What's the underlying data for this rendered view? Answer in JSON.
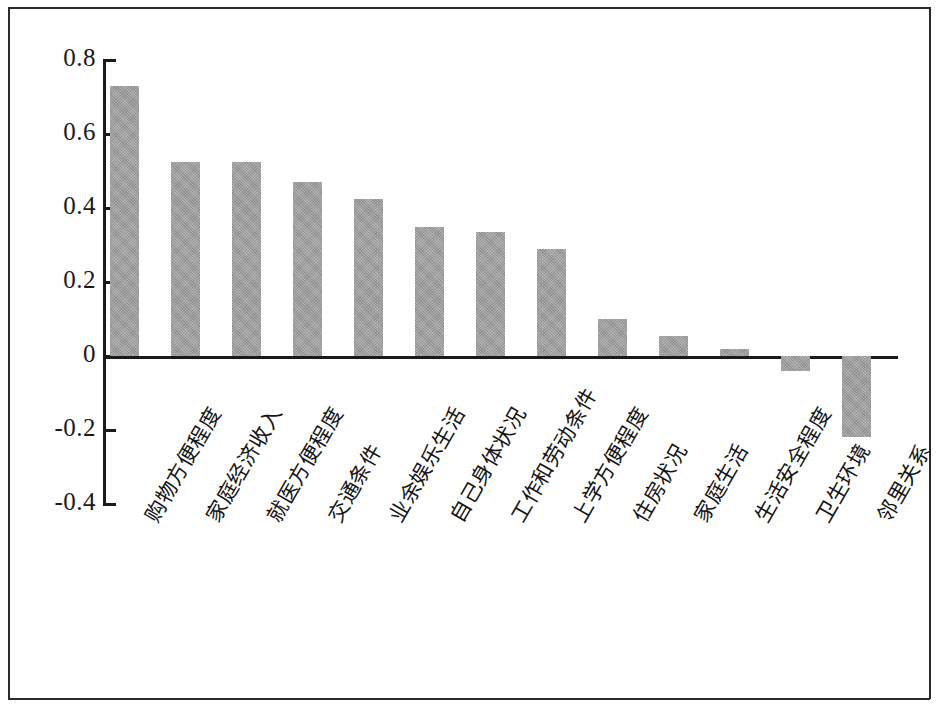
{
  "figure": {
    "background_color": "#ffffff",
    "frame_color": "#2b2b2b",
    "axis_color": "#1a1a1a",
    "bar_color": "#9b9b9b"
  },
  "chart_data": {
    "type": "bar",
    "title": "",
    "subtitle": "",
    "xlabel": "",
    "ylabel": "",
    "ylim": [
      -0.4,
      0.8
    ],
    "yticks": [
      "0.8",
      "0.6",
      "0.4",
      "0.2",
      "0",
      "-0.2",
      "-0.4"
    ],
    "ytick_values": [
      0.8,
      0.6,
      0.4,
      0.2,
      0,
      -0.2,
      -0.4
    ],
    "grid": false,
    "legend": null,
    "legend_position": "none",
    "categories": [
      "购物方便程度",
      "家庭经济收入",
      "就医方便程度",
      "交通条件",
      "业余娱乐生活",
      "自己身体状况",
      "工作和劳动条件",
      "上学方便程度",
      "住房状况",
      "家庭生活",
      "生活安全程度",
      "卫生环境",
      "邻里关系"
    ],
    "values": [
      0.73,
      0.525,
      0.525,
      0.47,
      0.425,
      0.35,
      0.335,
      0.29,
      0.1,
      0.055,
      0.02,
      -0.04,
      -0.22
    ],
    "bar_color": "#9b9b9b",
    "zero_line": 0
  }
}
